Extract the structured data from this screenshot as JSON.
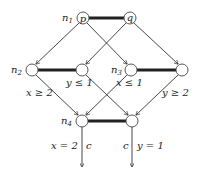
{
  "diagram": {
    "type": "lattice-flow-graph",
    "nodes": [
      {
        "id": "p",
        "label": "p",
        "name": "n1",
        "x": 83,
        "y": 18
      },
      {
        "id": "q",
        "label": "q",
        "x": 130,
        "y": 18
      },
      {
        "id": "n2",
        "label": "",
        "name": "n2",
        "x": 32,
        "y": 70
      },
      {
        "id": "m2",
        "label": "",
        "x": 82,
        "y": 70
      },
      {
        "id": "n3",
        "label": "",
        "name": "n3",
        "x": 131,
        "y": 70
      },
      {
        "id": "m3",
        "label": "",
        "x": 182,
        "y": 70
      },
      {
        "id": "n4",
        "label": "",
        "name": "n4",
        "x": 82,
        "y": 121
      },
      {
        "id": "m4",
        "label": "",
        "x": 132,
        "y": 121
      }
    ],
    "node_names": {
      "n1": "n",
      "n1_sub": "1",
      "n2": "n",
      "n2_sub": "2",
      "n3": "n",
      "n3_sub": "3",
      "n4": "n",
      "n4_sub": "4"
    },
    "node_labels": {
      "p": "p",
      "q": "q"
    },
    "edge_labels": {
      "x_ge_2": "x ≥ 2",
      "y_le_1": "y ≤ 1",
      "x_le_1": "x ≤ 1",
      "y_ge_2": "y ≥ 2",
      "x_eq_2": "x = 2",
      "c_left": "c",
      "c_right": "c",
      "y_eq_1": "y = 1"
    }
  }
}
